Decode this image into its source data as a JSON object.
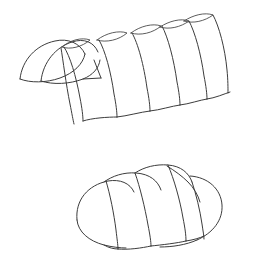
{
  "canvas": {
    "width": 255,
    "height": 272,
    "background_color": "#ffffff",
    "line_color": "#3c3c3c",
    "line_width": 1,
    "style": "monochrome line drawing, no text labels"
  },
  "figures": [
    {
      "id": "barrel-vault",
      "name": "barrel-vault-perspective",
      "description": "Perspective line drawing of a barrel (tunnel) vault built from a row of overlapping transverse arch segments receding to the left; a detached leaf-shaped lobe sits at the far left end and small lens shapes mark the ridge where successive arch crowns overlap.",
      "position": {
        "x": 0,
        "y": 0,
        "width": 255,
        "height": 140
      },
      "segment_count": 6,
      "ridge_lens_count": 5,
      "has_end_lobe": true,
      "bottom_edge": "scalloped",
      "ridge_direction": "rising left-to-right"
    },
    {
      "id": "segmented-dome",
      "name": "segmented-dome-loaf",
      "description": "Perspective line drawing of a low segmented dome or loaf-like vault made of four overlapping rounded lobes with a scalloped upper silhouette and a rounded cap at the left end.",
      "position": {
        "x": 0,
        "y": 140,
        "width": 255,
        "height": 132
      },
      "segment_count": 4,
      "cap_ends": 2,
      "top_edge": "scalloped",
      "bottom_edge": "continuous rounded"
    }
  ]
}
